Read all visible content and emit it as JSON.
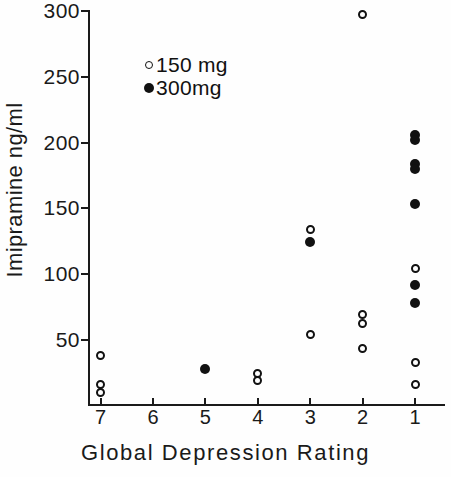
{
  "chart_data": {
    "type": "scatter",
    "title": "",
    "xlabel": "Global Depression Rating",
    "ylabel": "Imipramine ng/ml",
    "xlim": [
      7.5,
      0.5
    ],
    "ylim": [
      0,
      300
    ],
    "x_tick_labels": [
      "7",
      "6",
      "5",
      "4",
      "3",
      "2",
      "1"
    ],
    "x_tick_values": [
      7,
      6,
      5,
      4,
      3,
      2,
      1
    ],
    "y_tick_labels": [
      "300",
      "250",
      "200",
      "150",
      "100",
      "50"
    ],
    "y_tick_values": [
      300,
      250,
      200,
      150,
      100,
      50
    ],
    "grid": false,
    "legend_position": "upper-left-inside",
    "series": [
      {
        "name": "150 mg",
        "marker": "open-circle",
        "color": "#111111",
        "points": [
          {
            "x": 7,
            "y": 38
          },
          {
            "x": 7,
            "y": 16
          },
          {
            "x": 7,
            "y": 10
          },
          {
            "x": 4,
            "y": 24
          },
          {
            "x": 4,
            "y": 19
          },
          {
            "x": 3,
            "y": 134
          },
          {
            "x": 3,
            "y": 54
          },
          {
            "x": 2,
            "y": 297
          },
          {
            "x": 2,
            "y": 69
          },
          {
            "x": 2,
            "y": 62
          },
          {
            "x": 2,
            "y": 43
          },
          {
            "x": 1,
            "y": 104
          },
          {
            "x": 1,
            "y": 33
          },
          {
            "x": 1,
            "y": 16
          }
        ]
      },
      {
        "name": "300mg",
        "marker": "filled-circle",
        "color": "#111111",
        "points": [
          {
            "x": 5,
            "y": 28
          },
          {
            "x": 3,
            "y": 124
          },
          {
            "x": 1,
            "y": 206
          },
          {
            "x": 1,
            "y": 202
          },
          {
            "x": 1,
            "y": 184
          },
          {
            "x": 1,
            "y": 180
          },
          {
            "x": 1,
            "y": 153
          },
          {
            "x": 1,
            "y": 92
          },
          {
            "x": 1,
            "y": 78
          }
        ]
      }
    ]
  },
  "legend": {
    "entries": [
      {
        "label": "150 mg",
        "marker": "open-circle"
      },
      {
        "label": "300mg",
        "marker": "filled-circle"
      }
    ]
  },
  "axes": {
    "y_title": "Imipramine ng/ml",
    "x_title": "Global Depression Rating"
  }
}
